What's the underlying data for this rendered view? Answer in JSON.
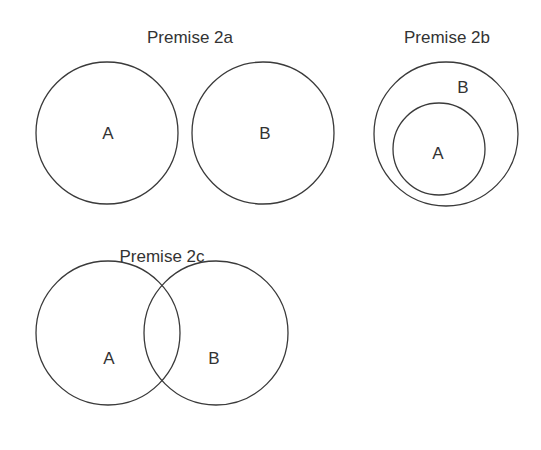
{
  "diagrams": [
    {
      "title": "Premise 2a",
      "relation": "disjoint",
      "circles": [
        {
          "label": "A",
          "cx": 107,
          "cy": 133,
          "r": 71
        },
        {
          "label": "B",
          "cx": 263,
          "cy": 133,
          "r": 71
        }
      ]
    },
    {
      "title": "Premise 2b",
      "relation": "A subset of B",
      "circles": [
        {
          "label": "B",
          "cx": 446,
          "cy": 134,
          "r": 72
        },
        {
          "label": "A",
          "cx": 439,
          "cy": 149,
          "r": 46
        }
      ]
    },
    {
      "title": "Premise 2c",
      "relation": "overlapping",
      "circles": [
        {
          "label": "A",
          "cx": 108,
          "cy": 333,
          "r": 72
        },
        {
          "label": "B",
          "cx": 216,
          "cy": 333,
          "r": 72
        }
      ]
    }
  ],
  "colors": {
    "stroke": "#3a3a3a",
    "text": "#333333",
    "background": "#ffffff"
  }
}
